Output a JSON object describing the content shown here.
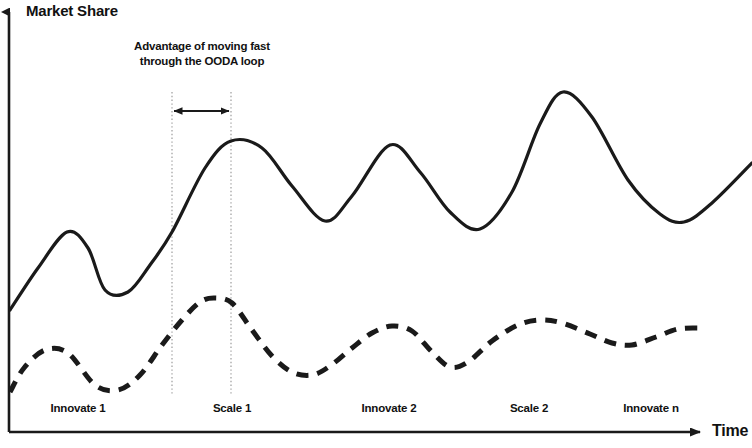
{
  "chart_data": {
    "type": "line",
    "title": "",
    "ylabel": "Market Share",
    "xlabel": "Time",
    "grid": false,
    "legend": "none",
    "axis_style": "arrow-axes, no tick marks, no numeric scale",
    "xlim": [
      0,
      752
    ],
    "ylim": [
      0,
      448
    ],
    "x_phase_labels": [
      "Innovate 1",
      "Scale 1",
      "Innovate 2",
      "Scale 2",
      "Innovate n"
    ],
    "annotations": [
      {
        "id": "ooda-advantage",
        "text_line_1": "Advantage of moving fast",
        "text_line_2": "through the OODA loop",
        "marker": "double-headed horizontal arrow spanning two dotted vertical guide lines",
        "guide_line_1_x": 172,
        "guide_line_2_x": 231,
        "arrow_y": 111
      }
    ],
    "series": [
      {
        "name": "Fast OODA-loop competitor",
        "style": "solid",
        "color": "#1a1a1a",
        "width": 3.2,
        "description": "Upper oscillating curve with rising peaks",
        "points": [
          [
            10,
            310
          ],
          [
            38,
            268
          ],
          [
            67,
            232
          ],
          [
            88,
            248
          ],
          [
            105,
            290
          ],
          [
            128,
            292
          ],
          [
            150,
            265
          ],
          [
            172,
            232
          ],
          [
            205,
            168
          ],
          [
            231,
            141
          ],
          [
            262,
            148
          ],
          [
            292,
            186
          ],
          [
            325,
            221
          ],
          [
            352,
            196
          ],
          [
            390,
            145
          ],
          [
            420,
            172
          ],
          [
            450,
            212
          ],
          [
            480,
            229
          ],
          [
            512,
            192
          ],
          [
            540,
            124
          ],
          [
            563,
            92
          ],
          [
            592,
            117
          ],
          [
            628,
            180
          ],
          [
            660,
            214
          ],
          [
            684,
            222
          ],
          [
            712,
            203
          ],
          [
            752,
            163
          ]
        ],
        "peaks": [
          [
            67,
            232
          ],
          [
            231,
            141
          ],
          [
            390,
            145
          ],
          [
            563,
            92
          ]
        ],
        "valleys": [
          [
            105,
            290
          ],
          [
            325,
            221
          ],
          [
            480,
            229
          ],
          [
            684,
            222
          ]
        ]
      },
      {
        "name": "Slower competitor",
        "style": "dashed",
        "color": "#1a1a1a",
        "width": 5,
        "dash_pattern": "12 9",
        "description": "Lower oscillating dashed curve with modest rising peaks",
        "points": [
          [
            10,
            392
          ],
          [
            24,
            368
          ],
          [
            45,
            350
          ],
          [
            68,
            353
          ],
          [
            95,
            385
          ],
          [
            118,
            390
          ],
          [
            140,
            375
          ],
          [
            162,
            345
          ],
          [
            182,
            320
          ],
          [
            200,
            302
          ],
          [
            215,
            298
          ],
          [
            232,
            303
          ],
          [
            252,
            330
          ],
          [
            272,
            356
          ],
          [
            292,
            372
          ],
          [
            312,
            375
          ],
          [
            330,
            366
          ],
          [
            352,
            348
          ],
          [
            372,
            333
          ],
          [
            392,
            326
          ],
          [
            412,
            331
          ],
          [
            432,
            352
          ],
          [
            450,
            367
          ],
          [
            468,
            362
          ],
          [
            492,
            341
          ],
          [
            518,
            325
          ],
          [
            540,
            320
          ],
          [
            562,
            323
          ],
          [
            590,
            334
          ],
          [
            612,
            343
          ],
          [
            632,
            345
          ],
          [
            656,
            337
          ],
          [
            678,
            329
          ],
          [
            700,
            328
          ]
        ],
        "peaks": [
          [
            45,
            350
          ],
          [
            215,
            298
          ],
          [
            392,
            326
          ],
          [
            540,
            320
          ]
        ],
        "valleys": [
          [
            95,
            385
          ],
          [
            312,
            375
          ],
          [
            450,
            367
          ],
          [
            632,
            345
          ]
        ]
      }
    ]
  },
  "axes": {
    "y_title": "Market Share",
    "x_title": "Time"
  },
  "annotation": {
    "line1": "Advantage of moving fast",
    "line2": "through the OODA loop"
  },
  "phases": [
    {
      "label": "Innovate 1"
    },
    {
      "label": "Scale 1"
    },
    {
      "label": "Innovate 2"
    },
    {
      "label": "Scale 2"
    },
    {
      "label": "Innovate n"
    }
  ],
  "colors": {
    "ink": "#1a1a1a",
    "guide": "#b5b5b5",
    "background": "#ffffff"
  }
}
